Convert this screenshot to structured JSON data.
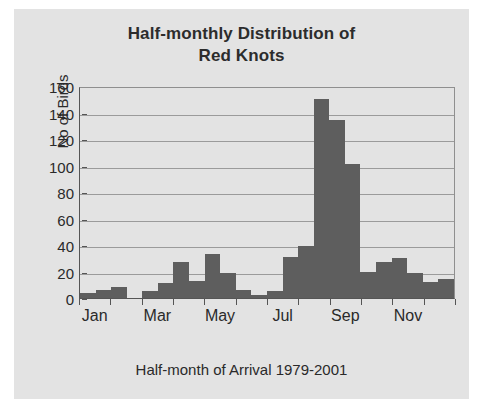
{
  "chart_data": {
    "type": "bar",
    "title": "Half-monthly Distribution of Red Knots",
    "title_line1": "Half-monthly Distribution of",
    "title_line2": "Red Knots",
    "xlabel": "Half-month of Arrival 1979-2001",
    "ylabel": "No of Birds",
    "ylim": [
      0,
      160
    ],
    "ytick_values": [
      0,
      20,
      40,
      60,
      80,
      100,
      120,
      140,
      160
    ],
    "ytick_labels": [
      "0",
      "20",
      "40",
      "60",
      "80",
      "100",
      "120",
      "140",
      "160"
    ],
    "grid": "horizontal",
    "legend": "none",
    "bar_color": "#5e5e5e",
    "plot_background": "#e3e3e3",
    "categories": [
      "Jan 1",
      "Jan 2",
      "Feb 1",
      "Feb 2",
      "Mar 1",
      "Mar 2",
      "Apr 1",
      "Apr 2",
      "May 1",
      "May 2",
      "Jun 1",
      "Jun 2",
      "Jul 1",
      "Jul 2",
      "Aug 1",
      "Aug 2",
      "Sep 1",
      "Sep 2",
      "Oct 1",
      "Oct 2",
      "Nov 1",
      "Nov 2",
      "Dec 1",
      "Dec 2"
    ],
    "values": [
      4,
      6,
      8,
      0,
      5,
      11,
      27,
      13,
      33,
      19,
      6,
      2,
      5,
      31,
      39,
      150,
      134,
      101,
      20,
      27,
      30,
      19,
      12,
      14
    ],
    "xtick_labels": [
      "Jan",
      "Mar",
      "May",
      "Jul",
      "Sep",
      "Nov"
    ],
    "xtick_category_index": [
      1,
      5,
      9,
      13,
      17,
      21
    ]
  }
}
